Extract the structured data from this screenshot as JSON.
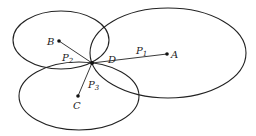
{
  "diagram": {
    "type": "geometric-figure",
    "points": {
      "A": {
        "label": "A",
        "x": 167,
        "y": 54
      },
      "B": {
        "label": "B",
        "x": 59,
        "y": 41
      },
      "C": {
        "label": "C",
        "x": 78,
        "y": 96
      },
      "D": {
        "label": "D",
        "x": 92,
        "y": 63
      }
    },
    "segments": {
      "P1": {
        "label": "P",
        "subscript": "1"
      },
      "P2": {
        "label": "P",
        "subscript": "2"
      },
      "P3": {
        "label": "P",
        "subscript": "3"
      }
    },
    "ellipses": [
      "ellipse-A",
      "ellipse-B",
      "ellipse-C"
    ],
    "colors": {
      "stroke": "#222222",
      "background": "#ffffff"
    }
  }
}
